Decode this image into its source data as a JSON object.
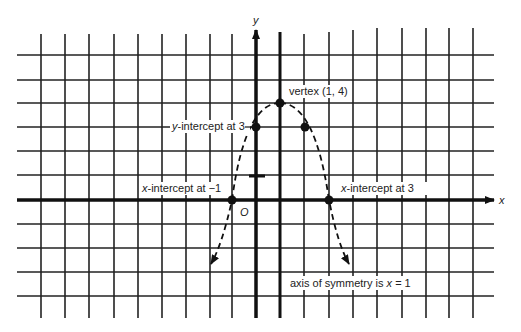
{
  "figure": {
    "type": "parabola-graph",
    "equation_described": "parabola with vertex (1, 4), opening downward",
    "axes": {
      "x_label": "x",
      "y_label": "y",
      "origin_label": "O"
    },
    "grid": {
      "origin_px": [
        256,
        200
      ],
      "unit_px": 24.3,
      "x_range": [
        -9,
        9
      ],
      "y_range": [
        -5,
        6
      ]
    },
    "points": [
      {
        "name": "vertex",
        "x": 1,
        "y": 4,
        "label": "vertex (1, 4)"
      },
      {
        "name": "y-intercept",
        "x": 0,
        "y": 3,
        "label_prefix": "y",
        "label_suffix": "-intercept at 3"
      },
      {
        "name": "mirror-point",
        "x": 2,
        "y": 3,
        "label": ""
      },
      {
        "name": "x-intercept-left",
        "x": -1,
        "y": 0,
        "label_prefix": "x",
        "label_suffix": "-intercept at −1"
      },
      {
        "name": "x-intercept-right",
        "x": 3,
        "y": 0,
        "label_prefix": "x",
        "label_suffix": "-intercept at 3"
      }
    ],
    "axis_of_symmetry": {
      "x": 1,
      "label_text": "axis of symmetry is ",
      "label_var": "x",
      "label_eq": " = 1"
    },
    "unit_tick": {
      "x": 0,
      "y": 1
    },
    "colors": {
      "ink": "#111111",
      "background": "#ffffff"
    }
  }
}
